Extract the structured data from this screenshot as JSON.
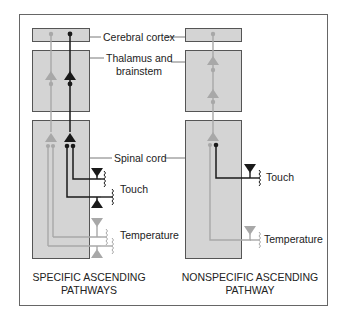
{
  "labels": {
    "cortex": "Cerebral cortex",
    "thalamus_line1": "Thalamus and",
    "thalamus_line2": "brainstem",
    "spinal": "Spinal cord",
    "touch_left": "Touch",
    "temperature_left": "Temperature",
    "touch_right": "Touch",
    "temperature_right": "Temperature"
  },
  "captions": {
    "specific_line1": "SPECIFIC ASCENDING",
    "specific_line2": "PATHWAYS",
    "nonspecific_line1": "NONSPECIFIC ASCENDING",
    "nonspecific_line2": "PATHWAY"
  },
  "colors": {
    "box_fill": "#d4d4d4",
    "box_stroke": "#555555",
    "touch_pathway": "#1a1a1a",
    "temperature_pathway": "#a8a8a8",
    "border": "#666666"
  }
}
